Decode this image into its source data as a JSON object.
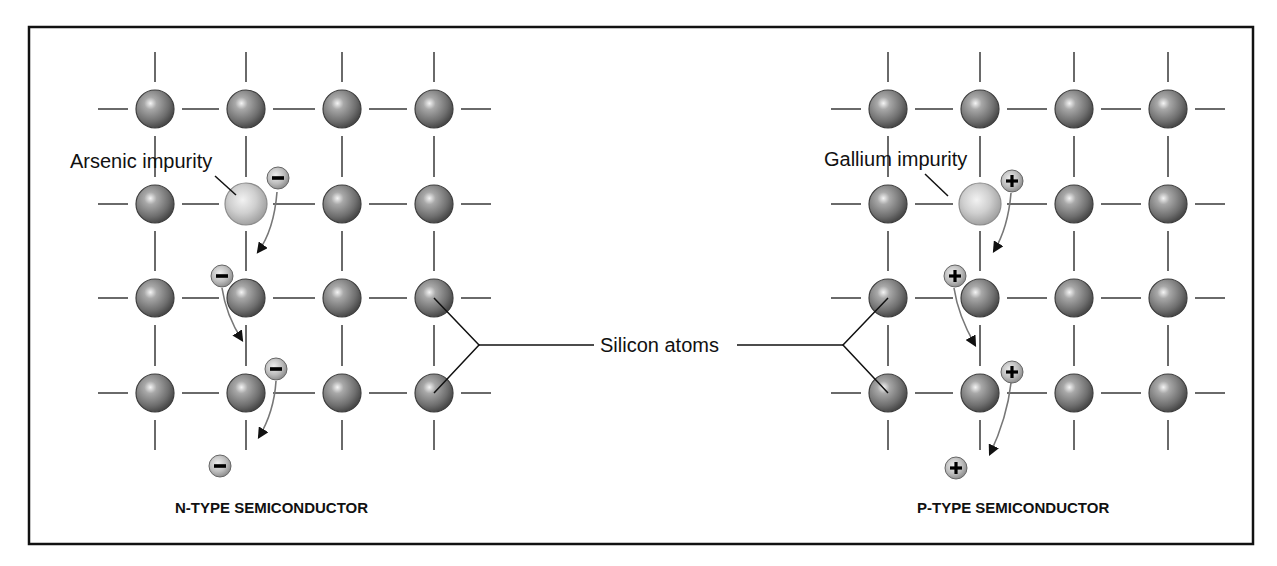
{
  "figure": {
    "n_type": {
      "title": "N-TYPE SEMICONDUCTOR",
      "impurity_label": "Arsenic impurity",
      "carrier_symbol": "−",
      "carrier_type": "electron"
    },
    "p_type": {
      "title": "P-TYPE SEMICONDUCTOR",
      "impurity_label": "Gallium impurity",
      "carrier_symbol": "+",
      "carrier_type": "hole"
    },
    "shared_label": "Silicon atoms",
    "colors": {
      "silicon_atom": "#7a7a7a",
      "impurity_atom": "#c8c8c8",
      "carrier": "#bdbdbd",
      "bond": "#6a6a6a",
      "frame": "#111111"
    },
    "grid": {
      "rows": 4,
      "cols": 4
    }
  }
}
